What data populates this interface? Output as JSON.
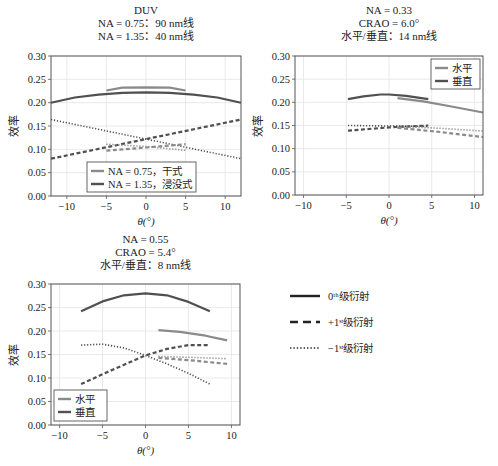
{
  "chart_data": [
    {
      "type": "line",
      "id": "duv",
      "title": [
        "DUV",
        "NA = 0.75：90 nm线",
        "NA = 1.35：40 nm线"
      ],
      "xlabel": "θ(°)",
      "ylabel": "效率",
      "xlim": [
        -12,
        12
      ],
      "ylim": [
        0,
        0.3
      ],
      "xticks": [
        -10,
        -5,
        0,
        5,
        10
      ],
      "yticks": [
        0.0,
        0.05,
        0.1,
        0.15,
        0.2,
        0.25,
        0.3
      ],
      "grid": true,
      "legend": {
        "position": "lower center",
        "entries": [
          {
            "label": "NA = 0.75，干式",
            "color": "#8a8a8a"
          },
          {
            "label": "NA = 1.35，浸没式",
            "color": "#505050"
          }
        ]
      },
      "series": [
        {
          "name": "NA=0.75 0th",
          "group": "NA = 0.75，干式",
          "order": "0th",
          "color": "#8a8a8a",
          "x": [
            -5,
            -3,
            0,
            3,
            5
          ],
          "y": [
            0.226,
            0.232,
            0.233,
            0.232,
            0.226
          ]
        },
        {
          "name": "NA=1.35 0th",
          "group": "NA = 1.35，浸没式",
          "order": "0th",
          "color": "#505050",
          "x": [
            -12,
            -9,
            -6,
            -3,
            0,
            3,
            6,
            9,
            12
          ],
          "y": [
            0.2,
            0.211,
            0.217,
            0.221,
            0.222,
            0.221,
            0.217,
            0.211,
            0.2
          ]
        },
        {
          "name": "NA=1.35 +1st",
          "group": "NA = 1.35，浸没式",
          "order": "+1st",
          "color": "#505050",
          "x": [
            -12,
            0,
            12
          ],
          "y": [
            0.08,
            0.122,
            0.164
          ]
        },
        {
          "name": "NA=1.35 -1st",
          "group": "NA = 1.35，浸没式",
          "order": "-1st",
          "color": "#505050",
          "x": [
            -12,
            0,
            12
          ],
          "y": [
            0.164,
            0.122,
            0.08
          ]
        },
        {
          "name": "NA=0.75 +1st",
          "group": "NA = 0.75，干式",
          "order": "+1st",
          "color": "#8a8a8a",
          "x": [
            -5,
            0,
            5
          ],
          "y": [
            0.097,
            0.104,
            0.111
          ]
        },
        {
          "name": "NA=0.75 -1st",
          "group": "NA = 0.75，干式",
          "order": "-1st",
          "color": "#8a8a8a",
          "x": [
            -5,
            0,
            5
          ],
          "y": [
            0.111,
            0.106,
            0.098
          ]
        }
      ]
    },
    {
      "type": "line",
      "id": "na033",
      "title": [
        "NA = 0.33",
        "CRAO = 6.0°",
        "水平/垂直：14 nm线"
      ],
      "xlabel": "θ(°)",
      "ylabel": "效率",
      "xlim": [
        -11,
        11
      ],
      "ylim": [
        0,
        0.3
      ],
      "xticks": [
        -10,
        -5,
        0,
        5,
        10
      ],
      "yticks": [
        0.0,
        0.05,
        0.1,
        0.15,
        0.2,
        0.25,
        0.3
      ],
      "grid": true,
      "legend": {
        "position": "upper right",
        "entries": [
          {
            "label": "水平",
            "color": "#8a8a8a"
          },
          {
            "label": "垂直",
            "color": "#505050"
          }
        ]
      },
      "series": [
        {
          "name": "垂直 0th",
          "group": "垂直",
          "order": "0th",
          "color": "#505050",
          "x": [
            -4.8,
            -3,
            -1,
            0,
            2,
            4.6
          ],
          "y": [
            0.207,
            0.213,
            0.217,
            0.217,
            0.214,
            0.207
          ]
        },
        {
          "name": "水平 0th",
          "group": "水平",
          "order": "0th",
          "color": "#8a8a8a",
          "x": [
            1,
            4,
            7,
            11
          ],
          "y": [
            0.209,
            0.202,
            0.192,
            0.178
          ]
        },
        {
          "name": "垂直 -1st",
          "group": "垂直",
          "order": "-1st",
          "color": "#505050",
          "x": [
            -4.8,
            0,
            4.6
          ],
          "y": [
            0.15,
            0.149,
            0.148
          ]
        },
        {
          "name": "垂直 +1st",
          "group": "垂直",
          "order": "+1st",
          "color": "#505050",
          "x": [
            -4.8,
            0,
            4.6
          ],
          "y": [
            0.139,
            0.146,
            0.15
          ]
        },
        {
          "name": "水平 -1st",
          "group": "水平",
          "order": "-1st",
          "color": "#8a8a8a",
          "x": [
            1,
            6,
            11
          ],
          "y": [
            0.148,
            0.144,
            0.138
          ]
        },
        {
          "name": "水平 +1st",
          "group": "水平",
          "order": "+1st",
          "color": "#8a8a8a",
          "x": [
            1,
            6,
            11
          ],
          "y": [
            0.145,
            0.136,
            0.125
          ]
        }
      ]
    },
    {
      "type": "line",
      "id": "na055",
      "title": [
        "NA = 0.55",
        "CRAO = 5.4°",
        "水平/垂直：8 nm线"
      ],
      "xlabel": "θ(°)",
      "ylabel": "效率",
      "xlim": [
        -11,
        11
      ],
      "ylim": [
        0,
        0.3
      ],
      "xticks": [
        -10,
        -5,
        0,
        5,
        10
      ],
      "yticks": [
        0.0,
        0.05,
        0.1,
        0.15,
        0.2,
        0.25,
        0.3
      ],
      "grid": true,
      "legend": {
        "position": "lower left",
        "entries": [
          {
            "label": "水平",
            "color": "#8a8a8a"
          },
          {
            "label": "垂直",
            "color": "#505050"
          }
        ]
      },
      "series": [
        {
          "name": "垂直 0th",
          "group": "垂直",
          "order": "0th",
          "color": "#505050",
          "x": [
            -7.5,
            -5,
            -2.5,
            0,
            2.5,
            5,
            7.5
          ],
          "y": [
            0.242,
            0.263,
            0.276,
            0.28,
            0.276,
            0.262,
            0.242
          ]
        },
        {
          "name": "水平 0th",
          "group": "水平",
          "order": "0th",
          "color": "#8a8a8a",
          "x": [
            1.5,
            4,
            7,
            9.5
          ],
          "y": [
            0.202,
            0.198,
            0.19,
            0.18
          ]
        },
        {
          "name": "垂直 -1st",
          "group": "垂直",
          "order": "-1st",
          "color": "#505050",
          "x": [
            -7.5,
            -5,
            -2.5,
            0,
            2.5,
            5,
            7.5
          ],
          "y": [
            0.17,
            0.172,
            0.164,
            0.148,
            0.13,
            0.11,
            0.087
          ]
        },
        {
          "name": "垂直 +1st",
          "group": "垂直",
          "order": "+1st",
          "color": "#505050",
          "x": [
            -7.5,
            -5,
            -2.5,
            0,
            2.5,
            5,
            7.5
          ],
          "y": [
            0.087,
            0.108,
            0.128,
            0.148,
            0.162,
            0.17,
            0.17
          ]
        },
        {
          "name": "水平 -1st",
          "group": "水平",
          "order": "-1st",
          "color": "#8a8a8a",
          "x": [
            1.5,
            5,
            9.5
          ],
          "y": [
            0.146,
            0.144,
            0.141
          ]
        },
        {
          "name": "水平 +1st",
          "group": "水平",
          "order": "+1st",
          "color": "#8a8a8a",
          "x": [
            1.5,
            5,
            9.5
          ],
          "y": [
            0.143,
            0.138,
            0.13
          ]
        }
      ]
    }
  ],
  "shared_legend": {
    "entries": [
      {
        "label": "0ᵗʰ级衍射",
        "style": "solid",
        "order": "0th"
      },
      {
        "label": "+1ˢᵗ级衍射",
        "style": "dashed",
        "order": "+1st"
      },
      {
        "label": "−1ˢᵗ级衍射",
        "style": "dotted",
        "order": "-1st"
      }
    ]
  }
}
